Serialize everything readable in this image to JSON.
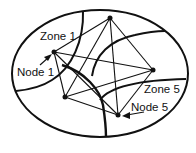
{
  "diagram": {
    "type": "zone-network",
    "stroke_color": "#111111",
    "background": "#ffffff",
    "boundary": {
      "shape": "ellipse",
      "cx": 100,
      "cy": 73.5,
      "rx": 88,
      "ry": 63.5
    },
    "labels": {
      "zone1": "Zone 1",
      "node1": "Node 1",
      "zone5": "Zone 5",
      "node5": "Node 5"
    },
    "nodes": [
      {
        "id": "node-1",
        "label": "Node 1",
        "x": 54,
        "y": 52
      },
      {
        "id": "node-top",
        "x": 110,
        "y": 18
      },
      {
        "id": "node-right",
        "x": 153,
        "y": 70
      },
      {
        "id": "node-bottom-left",
        "x": 65,
        "y": 97
      },
      {
        "id": "node-5",
        "label": "Node 5",
        "x": 118,
        "y": 115
      }
    ],
    "edges": [
      [
        "node-1",
        "node-top"
      ],
      [
        "node-1",
        "node-right"
      ],
      [
        "node-1",
        "node-bottom-left"
      ],
      [
        "node-1",
        "node-5"
      ],
      [
        "node-top",
        "node-right"
      ],
      [
        "node-top",
        "node-bottom-left"
      ],
      [
        "node-top",
        "node-5"
      ],
      [
        "node-right",
        "node-bottom-left"
      ],
      [
        "node-right",
        "node-5"
      ],
      [
        "node-bottom-left",
        "node-5"
      ]
    ]
  }
}
